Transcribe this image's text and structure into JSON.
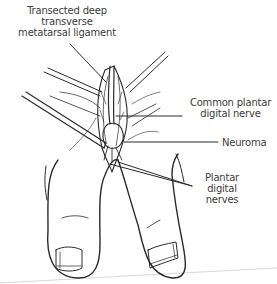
{
  "figure": {
    "labels": {
      "ligament": [
        "Transected deep",
        "transverse",
        "metatarsal ligament"
      ],
      "common_nerve": [
        "Common plantar",
        "digital nerve"
      ],
      "neuroma": [
        "Neuroma"
      ],
      "plantar_nerves": [
        "Plantar",
        "digital",
        "nerves"
      ]
    },
    "colors": {
      "line": "#2a2a2a",
      "text": "#3c3c3c",
      "background": "#ffffff"
    }
  }
}
